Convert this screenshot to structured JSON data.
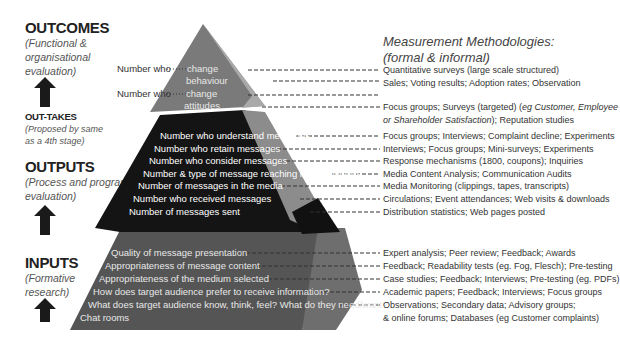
{
  "left_column": {
    "outcomes": {
      "title": "OUTCOMES",
      "subtitle_lines": [
        "(Functional &",
        "organisational",
        "evaluation)"
      ]
    },
    "outtakes": {
      "title": "OUT-TAKES",
      "subtitle_lines": [
        "(Proposed by same",
        "as a 4th stage)"
      ]
    },
    "outputs": {
      "title": "OUTPUTS",
      "subtitle_lines": [
        "(Process and program",
        "evaluation)"
      ]
    },
    "inputs": {
      "title": "INPUTS",
      "subtitle_lines": [
        "(Formative",
        "research)"
      ]
    },
    "arrow_icon": "up-arrow-icon"
  },
  "pyramid": {
    "colors": {
      "top": "#7a7a7a",
      "top_side": "#a9a9a9",
      "middle": "#141414",
      "middle_side": "#8c8c8c",
      "base": "#555555",
      "base_side": "#6e6e6e"
    },
    "outcomes_left_labels": [
      "Number who",
      "Number who"
    ],
    "outcomes_labels": [
      "change",
      "behaviour",
      "change",
      "attitudes"
    ],
    "outputs_labels": [
      "Number who understand messages",
      "Number who retain messages",
      "Number who consider messages",
      "Number & type of message reaching large audience",
      "Number of messages in the media",
      "Number who received messages",
      "Number of messages sent"
    ],
    "inputs_labels": [
      "Quality of message presentation",
      "Appropriateness of message content",
      "Appropriateness of the medium selected",
      "How does target audience prefer to receive information?",
      "What does target audience know, think, feel? What do they need/want?",
      "Chat rooms"
    ]
  },
  "methodologies": {
    "heading_lines": [
      "Measurement Methodologies:",
      "(formal & informal)"
    ],
    "outcomes": [
      "Quantitative surveys (large scale structured)",
      "Sales; Voting results; Adoption rates; Observation"
    ],
    "outcomes_focus": {
      "prefix": "Focus groups; Surveys (targeted) (",
      "italic1": "eg Customer, Employee",
      "line2_italic": "or Shareholder Satisfaction",
      "suffix": "); Reputation studies"
    },
    "outputs": [
      "Focus groups; Interviews; Complaint decline; Experiments",
      "Interviews; Focus groups; Mini-surveys; Experiments",
      "Response mechanisms (1800, coupons); Inquiries",
      "Media Content Analysis; Communication Audits",
      "Media Monitoring (clippings, tapes, transcripts)",
      "Circulations; Event attendances; Web visits & downloads",
      "Distribution statistics; Web pages posted"
    ],
    "inputs": [
      "Expert analysis; Peer review; Feedback; Awards",
      "Feedback; Readability tests (eg. Fog, Flesch); Pre-testing",
      "Case studies; Feedback; Interviews; Pre-testing (eg. PDFs)",
      "Academic papers; Feedback; Interviews; Focus groups",
      "Observations; Secondary data; Advisory groups;",
      "& online forums; Databases (eg Customer complaints)"
    ]
  }
}
